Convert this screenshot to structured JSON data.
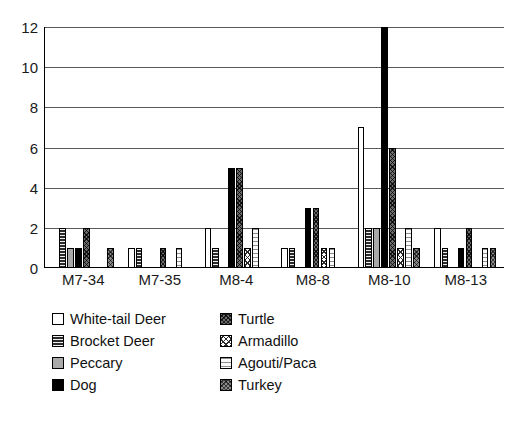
{
  "chart_data": {
    "type": "bar",
    "title": "",
    "subtitle": "",
    "xlabel": "",
    "ylabel": "",
    "ylim": [
      0,
      12
    ],
    "ytick_step": 2,
    "ytick_labels": [
      "0",
      "2",
      "4",
      "6",
      "8",
      "10",
      "12"
    ],
    "grid": true,
    "grid_orientation": "horizontal",
    "legend_position": "below-plot",
    "categories": [
      "M7-34",
      "M7-35",
      "M8-4",
      "M8-8",
      "M8-10",
      "M8-13"
    ],
    "series": [
      {
        "name": "White-tail Deer",
        "fill": "white",
        "values": [
          0,
          1,
          2,
          1,
          7,
          2
        ]
      },
      {
        "name": "Brocket Deer",
        "fill": "brocket",
        "values": [
          2,
          1,
          1,
          1,
          2,
          1
        ]
      },
      {
        "name": "Peccary",
        "fill": "peccary",
        "values": [
          1,
          0,
          0,
          0,
          2,
          0
        ]
      },
      {
        "name": "Dog",
        "fill": "dog",
        "values": [
          1,
          0,
          5,
          3,
          12,
          1
        ]
      },
      {
        "name": "Turtle",
        "fill": "turtle",
        "values": [
          2,
          1,
          5,
          3,
          6,
          2
        ]
      },
      {
        "name": "Armadillo",
        "fill": "armadillo",
        "values": [
          0,
          0,
          1,
          1,
          1,
          0
        ]
      },
      {
        "name": "Agouti/Paca",
        "fill": "agouti",
        "values": [
          0,
          1,
          2,
          1,
          2,
          1
        ]
      },
      {
        "name": "Turkey",
        "fill": "turkey",
        "values": [
          1,
          0,
          0,
          0,
          1,
          1
        ]
      }
    ]
  },
  "legend": {
    "entries": [
      {
        "label": "White-tail Deer",
        "fill": "white"
      },
      {
        "label": "Turtle",
        "fill": "turtle"
      },
      {
        "label": "Brocket Deer",
        "fill": "brocket"
      },
      {
        "label": "Armadillo",
        "fill": "armadillo"
      },
      {
        "label": "Peccary",
        "fill": "peccary"
      },
      {
        "label": "Agouti/Paca",
        "fill": "agouti"
      },
      {
        "label": "Dog",
        "fill": "dog"
      },
      {
        "label": "Turkey",
        "fill": "turkey"
      }
    ]
  },
  "colors": {
    "axis": "#000000",
    "gridline": "#5a5a5a",
    "background": "#ffffff",
    "text": "#1a1a1a"
  }
}
